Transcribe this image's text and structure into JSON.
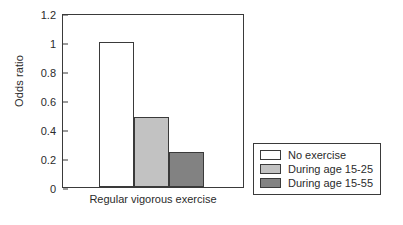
{
  "chart_data": {
    "type": "bar",
    "title": "",
    "xlabel": "Regular vigorous exercise",
    "ylabel": "Odds ratio",
    "categories": [
      "No exercise",
      "During age 15-25",
      "During age 15-55"
    ],
    "values": [
      1.0,
      0.48,
      0.24
    ],
    "ylim": [
      0,
      1.2
    ],
    "yticks": [
      "0",
      "0.2",
      "0.4",
      "0.6",
      "0.8",
      "1",
      "1.2"
    ],
    "ytick_values": [
      0,
      0.2,
      0.4,
      0.6,
      0.8,
      1,
      1.2
    ],
    "grid": false,
    "legend_position": "right",
    "series": [
      {
        "name": "No exercise",
        "value": 1.0,
        "color": "#ffffff"
      },
      {
        "name": "During age 15-25",
        "value": 0.48,
        "color": "#c2c2c2"
      },
      {
        "name": "During age 15-55",
        "value": 0.24,
        "color": "#828282"
      }
    ],
    "colors": {
      "axis": "#3a3a3a",
      "text": "#2b2b2b",
      "background": "#ffffff",
      "bar_no_exercise": "#ffffff",
      "bar_age_15_25": "#c2c2c2",
      "bar_age_15_55": "#828282"
    }
  },
  "legend": {
    "items": [
      {
        "label": "No exercise",
        "color": "#ffffff"
      },
      {
        "label": "During age 15-25",
        "color": "#c2c2c2"
      },
      {
        "label": "During age 15-55",
        "color": "#828282"
      }
    ]
  }
}
